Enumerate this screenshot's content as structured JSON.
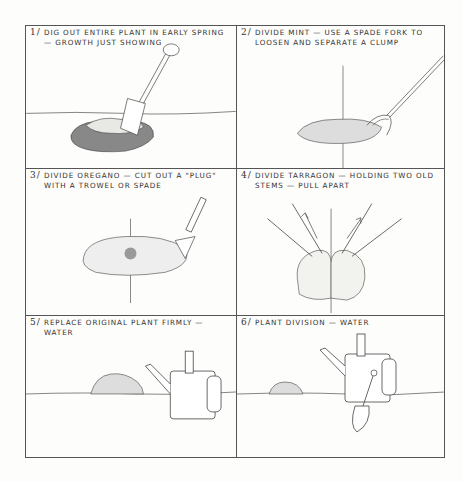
{
  "sheet": {
    "title": "Plant division steps",
    "line_color": "#555555",
    "background": "#fdfdfb",
    "panels": [
      {
        "number": "1/",
        "caption": "Dig out entire plant in early spring — growth just showing",
        "illustration": "spade-digging-plant-icon"
      },
      {
        "number": "2/",
        "caption": "Divide mint — use a spade fork to loosen and separate a clump",
        "illustration": "spade-fork-in-mint-icon"
      },
      {
        "number": "3/",
        "caption": "Divide oregano — cut out a \"plug\" with a trowel or spade",
        "illustration": "trowel-cutting-oregano-icon"
      },
      {
        "number": "4/",
        "caption": "Divide tarragon — holding two old stems — pull apart",
        "illustration": "tarragon-pulled-apart-icon"
      },
      {
        "number": "5/",
        "caption": "Replace original plant firmly — water",
        "illustration": "watering-can-replanted-icon"
      },
      {
        "number": "6/",
        "caption": "Plant division — water",
        "illustration": "watering-can-trowel-division-icon"
      }
    ]
  }
}
